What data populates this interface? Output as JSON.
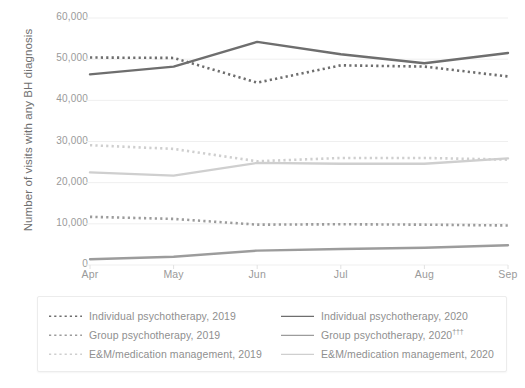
{
  "chart_data": {
    "type": "line",
    "title": "",
    "xlabel": "",
    "ylabel": "Number of visits with any BH diagnosis",
    "categories": [
      "Apr",
      "May",
      "Jun",
      "Jul",
      "Aug",
      "Sep"
    ],
    "ylim": [
      0,
      60000
    ],
    "yticks": [
      0,
      10000,
      20000,
      30000,
      40000,
      50000,
      60000
    ],
    "ytick_labels": [
      "0",
      "10,000",
      "20,000",
      "30,000",
      "40,000",
      "50,000",
      "60,000"
    ],
    "grid": true,
    "legend_position": "bottom",
    "series": [
      {
        "name": "Individual psychotherapy, 2019",
        "style": "dotted",
        "color": "#6e6e6e",
        "values": [
          50400,
          50300,
          44300,
          48500,
          48200,
          45800
        ]
      },
      {
        "name": "Individual psychotherapy, 2020",
        "style": "solid",
        "color": "#6e6e6e",
        "values": [
          46300,
          48200,
          54200,
          51200,
          49000,
          51500
        ]
      },
      {
        "name": "Group psychotherapy, 2019",
        "style": "dotted",
        "color": "#9c9c9c",
        "values": [
          11700,
          11200,
          9800,
          9900,
          9800,
          9600
        ]
      },
      {
        "name": "Group psychotherapy, 2020",
        "style": "solid",
        "color": "#9c9c9c",
        "suffix": "†††",
        "values": [
          1400,
          2000,
          3500,
          3900,
          4200,
          4800
        ]
      },
      {
        "name": "E&M/medication management, 2019",
        "style": "dotted",
        "color": "#cfcfcf",
        "values": [
          29100,
          28200,
          25200,
          26000,
          26000,
          25600
        ]
      },
      {
        "name": "E&M/medication management, 2020",
        "style": "solid",
        "color": "#cfcfcf",
        "values": [
          22500,
          21700,
          24800,
          24600,
          24600,
          25900
        ]
      }
    ]
  },
  "axes": {
    "y_title": "Number of visits with any BH diagnosis",
    "y_labels": [
      "60,000",
      "50,000",
      "40,000",
      "30,000",
      "20,000",
      "10,000",
      "0"
    ],
    "x_labels": [
      "Apr",
      "May",
      "Jun",
      "Jul",
      "Aug",
      "Sep"
    ]
  },
  "legend": {
    "column_left": [
      {
        "label": "Individual psychotherapy, 2019",
        "style": "dotted",
        "color": "#6e6e6e"
      },
      {
        "label": "Group psychotherapy, 2019",
        "style": "dotted",
        "color": "#9c9c9c"
      },
      {
        "label": "E&M/medication management, 2019",
        "style": "dotted",
        "color": "#cfcfcf"
      }
    ],
    "column_right": [
      {
        "label": "Individual psychotherapy, 2020",
        "style": "solid",
        "color": "#6e6e6e"
      },
      {
        "label": "Group psychotherapy, 2020",
        "style": "solid",
        "color": "#9c9c9c",
        "suffix": "†††"
      },
      {
        "label": "E&M/medication management, 2020",
        "style": "solid",
        "color": "#cfcfcf"
      }
    ]
  },
  "style": {
    "background": "#ffffff",
    "gridline_color": "#efefef",
    "tick_text_color": "#9a9a9a",
    "axis_title_color": "#6f6f6f",
    "legend_border": "#ececec"
  }
}
